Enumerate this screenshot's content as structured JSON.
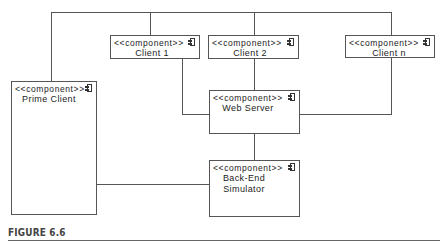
{
  "diagram": {
    "type": "UML component diagram",
    "stereotype": "<<component>>",
    "components": [
      {
        "id": "prime-client",
        "name": "Prime Client"
      },
      {
        "id": "client-1",
        "name": "Client 1"
      },
      {
        "id": "client-2",
        "name": "Client 2"
      },
      {
        "id": "client-n",
        "name": "Client n"
      },
      {
        "id": "web-server",
        "name": "Web Server"
      },
      {
        "id": "back-end",
        "name_line1": "Back-End",
        "name_line2": "Simulator"
      }
    ],
    "connections": [
      [
        "Prime Client",
        "Client 1"
      ],
      [
        "Prime Client",
        "Client 2"
      ],
      [
        "Prime Client",
        "Client n"
      ],
      [
        "Client 1",
        "Web Server"
      ],
      [
        "Client 2",
        "Web Server"
      ],
      [
        "Client n",
        "Web Server"
      ],
      [
        "Web Server",
        "Back-End Simulator"
      ],
      [
        "Prime Client",
        "Back-End Simulator"
      ]
    ]
  },
  "caption": "FIGURE 6.6"
}
